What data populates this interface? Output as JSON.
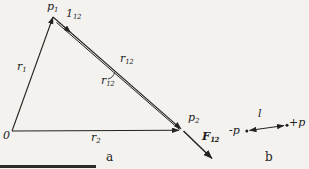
{
  "figure": {
    "colors": {
      "paper": "#f3f2ee",
      "ink": "#24221f"
    },
    "part_a": {
      "caption": "a",
      "origin_label": "0",
      "point1": {
        "base": "p",
        "sub": "1"
      },
      "point2": {
        "base": "p",
        "sub": "2"
      },
      "radius1": {
        "base": "r",
        "sub": "1"
      },
      "radius2": {
        "base": "r",
        "sub": "2"
      },
      "r12_vector": {
        "base": "r",
        "sub": "12"
      },
      "r12_distance": {
        "base": "r",
        "sub": "12"
      },
      "unit_vector": {
        "base": "1",
        "sub": "12"
      },
      "force": {
        "base": "F",
        "sub": "12"
      }
    },
    "part_b": {
      "caption": "b",
      "negative_charge": "-p",
      "positive_charge": "+p",
      "length_label": "l"
    }
  }
}
